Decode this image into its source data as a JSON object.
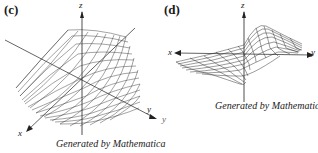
{
  "figures": [
    {
      "id": "c",
      "label": "(c)",
      "axes": {
        "x": "x",
        "y": "y",
        "z": "z"
      },
      "caption": "Generated by Mathematica",
      "surface": "wireframe surface with a saddle-like ridge/valley running diagonally"
    },
    {
      "id": "d",
      "label": "(d)",
      "axes": {
        "x": "x",
        "y": "y",
        "z": "z"
      },
      "caption": "Generated by Mathematica",
      "surface": "wireframe surface with a twisted peak and trough along the x-y axis",
      "stray_label": "y"
    }
  ]
}
